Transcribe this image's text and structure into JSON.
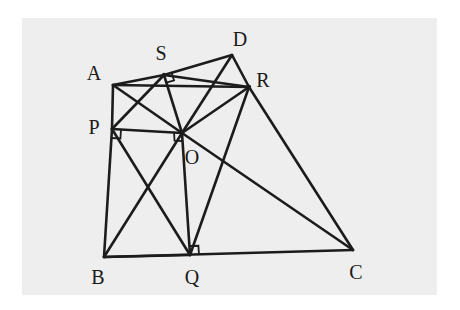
{
  "figure": {
    "kind": "geometry-diagram",
    "title": "",
    "canvas": {
      "width": 460,
      "height": 310,
      "plate_left": 22,
      "plate_top": 18,
      "plate_width": 415,
      "plate_height": 277,
      "page_color": "#ffffff",
      "plate_color": "#eeeeee",
      "ink_color": "#1c1c1c"
    },
    "points": [
      {
        "name": "A",
        "x": 113,
        "y": 85,
        "label": "A",
        "label_x": 94,
        "label_y": 73
      },
      {
        "name": "S",
        "x": 164,
        "y": 75,
        "label": "S",
        "label_x": 161,
        "label_y": 53
      },
      {
        "name": "D",
        "x": 232,
        "y": 55,
        "label": "D",
        "label_x": 240,
        "label_y": 39
      },
      {
        "name": "R",
        "x": 249,
        "y": 87,
        "label": "R",
        "label_x": 263,
        "label_y": 80
      },
      {
        "name": "P",
        "x": 112,
        "y": 129,
        "label": "P",
        "label_x": 94,
        "label_y": 127
      },
      {
        "name": "O",
        "x": 182,
        "y": 133,
        "label": "O",
        "label_x": 192,
        "label_y": 157
      },
      {
        "name": "B",
        "x": 104,
        "y": 257,
        "label": "B",
        "label_x": 98,
        "label_y": 277
      },
      {
        "name": "Q",
        "x": 190,
        "y": 255,
        "label": "Q",
        "label_x": 192,
        "label_y": 277
      },
      {
        "name": "C",
        "x": 353,
        "y": 250,
        "label": "C",
        "label_x": 356,
        "label_y": 272
      }
    ],
    "segments": [
      {
        "from": "A",
        "to": "S",
        "role": "quad-ASOP-side"
      },
      {
        "from": "S",
        "to": "D",
        "role": "outer-edge"
      },
      {
        "from": "D",
        "to": "R",
        "role": "quad-SDRO-side"
      },
      {
        "from": "R",
        "to": "C",
        "role": "outer-edge"
      },
      {
        "from": "C",
        "to": "B",
        "role": "base-edge"
      },
      {
        "from": "B",
        "to": "P",
        "role": "quad-POQB-side"
      },
      {
        "from": "P",
        "to": "A",
        "role": "quad-ASOP-side"
      },
      {
        "from": "A",
        "to": "O",
        "role": "diagonal"
      },
      {
        "from": "S",
        "to": "P",
        "role": "diagonal"
      },
      {
        "from": "S",
        "to": "O",
        "role": "quad-side"
      },
      {
        "from": "P",
        "to": "O",
        "role": "quad-side"
      },
      {
        "from": "D",
        "to": "O",
        "role": "diagonal"
      },
      {
        "from": "S",
        "to": "R",
        "role": "diagonal"
      },
      {
        "from": "R",
        "to": "O",
        "role": "quad-side"
      },
      {
        "from": "O",
        "to": "Q",
        "role": "quad-side"
      },
      {
        "from": "Q",
        "to": "B",
        "role": "quad-POQB-side"
      },
      {
        "from": "P",
        "to": "Q",
        "role": "diagonal"
      },
      {
        "from": "B",
        "to": "O",
        "role": "diagonal"
      },
      {
        "from": "O",
        "to": "C",
        "role": "diagonal"
      },
      {
        "from": "Q",
        "to": "R",
        "role": "diagonal"
      },
      {
        "from": "A",
        "to": "R",
        "role": "long-chord"
      }
    ],
    "right_angles": [
      {
        "at": "P",
        "between": [
          "B",
          "O"
        ],
        "size": 9
      },
      {
        "at": "S",
        "between": [
          "O",
          "D"
        ],
        "size": 8
      },
      {
        "at": "Q",
        "between": [
          "C",
          "O"
        ],
        "size": 9
      },
      {
        "at": "O",
        "between": [
          "P",
          "Q"
        ],
        "size": 8
      }
    ]
  }
}
